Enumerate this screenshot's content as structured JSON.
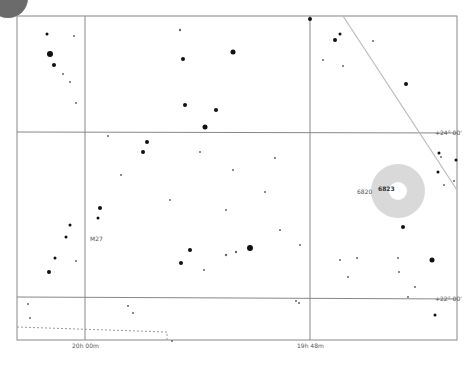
{
  "map": {
    "frame": {
      "x": 17,
      "y": 16,
      "w": 440,
      "h": 324
    },
    "grid": {
      "ra_lines": [
        {
          "x": 85,
          "label": "20h 00m"
        },
        {
          "x": 310,
          "label": "19h 48m"
        }
      ],
      "dec_lines": [
        {
          "y": 132,
          "label": "+24° 00'"
        },
        {
          "y": 297,
          "label": "+22° 00'"
        }
      ]
    },
    "objects": [
      {
        "id": "6823",
        "label": "6823",
        "x": 398,
        "y": 191
      },
      {
        "id": "6820",
        "label": "6820",
        "x": 365,
        "y": 193
      },
      {
        "id": "m27",
        "label": "M27",
        "x": 90,
        "y": 238
      }
    ],
    "nebula": {
      "cx": 398,
      "cy": 191,
      "r": 27,
      "inner_r": 9,
      "color": "#d9d9d9"
    },
    "diagonal_line": {
      "x1": 343,
      "y1": 16,
      "x2": 457,
      "y2": 190
    },
    "dashed_boundary": {
      "points": "17,327 167,332 167,340"
    },
    "stars": [
      [
        50,
        54,
        3
      ],
      [
        54,
        65,
        2
      ],
      [
        47,
        34,
        1.5
      ],
      [
        63,
        74,
        1
      ],
      [
        74,
        36,
        1
      ],
      [
        70,
        82,
        1
      ],
      [
        76,
        103,
        1
      ],
      [
        233,
        52,
        2.5
      ],
      [
        183,
        59,
        2
      ],
      [
        180,
        30,
        1.2
      ],
      [
        216,
        110,
        2
      ],
      [
        205,
        127,
        2.5
      ],
      [
        185,
        105,
        2
      ],
      [
        147,
        142,
        2
      ],
      [
        143,
        152,
        2
      ],
      [
        121,
        175,
        1
      ],
      [
        108,
        136,
        1
      ],
      [
        100,
        208,
        2
      ],
      [
        98,
        218,
        1.5
      ],
      [
        310,
        19,
        2
      ],
      [
        335,
        40,
        2
      ],
      [
        340,
        34,
        1.5
      ],
      [
        373,
        41,
        1
      ],
      [
        323,
        60,
        1
      ],
      [
        343,
        66,
        1
      ],
      [
        406,
        84,
        2
      ],
      [
        439,
        153,
        1.5
      ],
      [
        441,
        157,
        1
      ],
      [
        438,
        172,
        1.5
      ],
      [
        444,
        185,
        1
      ],
      [
        403,
        227,
        2
      ],
      [
        250,
        248,
        3
      ],
      [
        190,
        250,
        2
      ],
      [
        181,
        263,
        2
      ],
      [
        226,
        255,
        1.2
      ],
      [
        236,
        252,
        1.2
      ],
      [
        204,
        270,
        1
      ],
      [
        340,
        260,
        1
      ],
      [
        357,
        258,
        1
      ],
      [
        432,
        260,
        2.5
      ],
      [
        398,
        258,
        1
      ],
      [
        399,
        272,
        1
      ],
      [
        348,
        277,
        1
      ],
      [
        415,
        287,
        1
      ],
      [
        408,
        297,
        1
      ],
      [
        49,
        272,
        2
      ],
      [
        55,
        258,
        1.5
      ],
      [
        66,
        237,
        1.5
      ],
      [
        70,
        225,
        1.5
      ],
      [
        76,
        261,
        1
      ],
      [
        28,
        304,
        1
      ],
      [
        30,
        318,
        1
      ],
      [
        128,
        306,
        1
      ],
      [
        133,
        313,
        1
      ],
      [
        456,
        160,
        1.5
      ],
      [
        454,
        181,
        1
      ],
      [
        172,
        341,
        1
      ],
      [
        296,
        301,
        1
      ],
      [
        299,
        303,
        1
      ],
      [
        435,
        315,
        1.5
      ],
      [
        300,
        245,
        1
      ],
      [
        265,
        192,
        1
      ],
      [
        233,
        170,
        1
      ],
      [
        226,
        210,
        1
      ],
      [
        200,
        152,
        1
      ],
      [
        275,
        158,
        1
      ],
      [
        280,
        230,
        1
      ],
      [
        170,
        200,
        1
      ]
    ]
  }
}
